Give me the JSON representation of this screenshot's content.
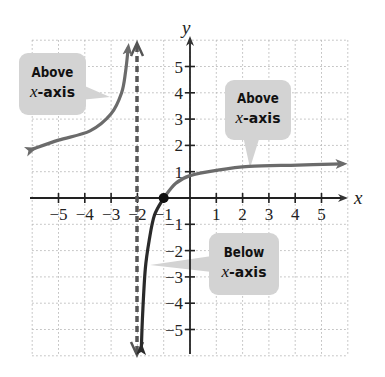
{
  "chart_data": {
    "type": "line",
    "title": "",
    "xlabel": "x",
    "ylabel": "y",
    "xlim": [
      -6,
      6
    ],
    "ylim": [
      -6,
      6
    ],
    "grid": true,
    "x_ticks": [
      "-5",
      "-4",
      "-3",
      "-2",
      "-1",
      "1",
      "2",
      "3",
      "4",
      "5"
    ],
    "y_ticks": [
      "5",
      "4",
      "3",
      "2",
      "1",
      "-1",
      "-2",
      "-3",
      "-4",
      "-5"
    ],
    "vertical_asymptote": {
      "x": -2,
      "style": "dashed"
    },
    "marked_point": {
      "x": -1,
      "y": 0
    },
    "series": [
      {
        "name": "left branch",
        "color": "#6b6b6b",
        "points": [
          [
            -6,
            1.85
          ],
          [
            -5,
            2.2
          ],
          [
            -3.8,
            2.55
          ],
          [
            -3,
            3.2
          ],
          [
            -2.6,
            4.0
          ],
          [
            -2.45,
            4.8
          ],
          [
            -2.35,
            5.7
          ]
        ]
      },
      {
        "name": "right branch lower",
        "color": "#333333",
        "points": [
          [
            -1.85,
            -5.7
          ],
          [
            -1.8,
            -4.4
          ],
          [
            -1.7,
            -2.7
          ],
          [
            -1.55,
            -1.6
          ],
          [
            -1.35,
            -0.65
          ],
          [
            -1,
            0
          ]
        ]
      },
      {
        "name": "right branch upper",
        "color": "#6b6b6b",
        "points": [
          [
            -1,
            0
          ],
          [
            -0.55,
            0.55
          ],
          [
            0,
            0.85
          ],
          [
            1,
            1.05
          ],
          [
            2.25,
            1.2
          ],
          [
            4.1,
            1.25
          ],
          [
            5.8,
            1.3
          ]
        ]
      }
    ],
    "annotations": [
      {
        "line1": "Above",
        "line2_var": "x",
        "line2_rest": "-axis",
        "target": "left branch"
      },
      {
        "line1": "Above",
        "line2_var": "x",
        "line2_rest": "-axis",
        "target": "right branch upper"
      },
      {
        "line1": "Below",
        "line2_var": "x",
        "line2_rest": "-axis",
        "target": "right branch lower"
      }
    ]
  }
}
